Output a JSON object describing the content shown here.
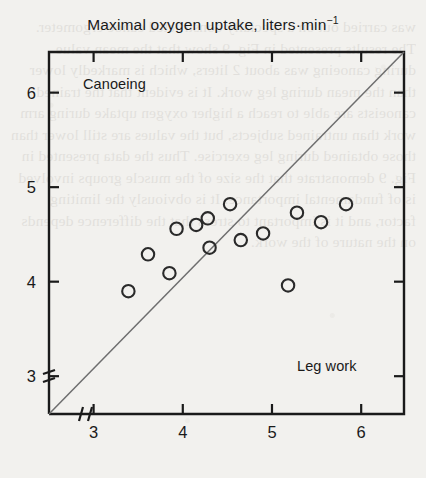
{
  "figure": {
    "title_main": "Maximal oxygen uptake, liters",
    "title_unit": "·min",
    "title_exp": "−1",
    "y_axis_label": "Canoeing",
    "x_axis_label": "Leg work"
  },
  "ghost_text": "was carried out on a specially constructed canoe ergometer. The results presented in Fig. 9 show that the mean value during canoeing was about 2 liters, which is markedly lower than the mean during leg work. It is evident that the trained canoeists are able to reach a higher oxygen uptake during arm work than untrained subjects, but the values are still lower than those obtained during leg exercise. Thus the data presented in Fig. 9 demonstrate that the size of the muscle groups involved is of fundamental importance. It is obviously the limiting factor, and it is important to stress that the difference depends on the nature of the work.",
  "chart_data": {
    "type": "scatter",
    "title": "Maximal oxygen uptake, liters·min−1",
    "xlabel": "Leg work",
    "ylabel": "Canoeing",
    "xlim": [
      2.5,
      6.48
    ],
    "ylim": [
      2.6,
      6.43
    ],
    "xticks": [
      3,
      4,
      5,
      6
    ],
    "yticks": [
      3,
      4,
      5,
      6
    ],
    "grid": false,
    "legend": null,
    "axis_break_x": true,
    "axis_break_y": true,
    "reference_line": {
      "name": "line-of-identity",
      "type": "identity",
      "from": [
        2.5,
        2.6
      ],
      "to": [
        6.48,
        6.43
      ]
    },
    "points": [
      {
        "x": 3.39,
        "y": 3.9
      },
      {
        "x": 3.61,
        "y": 4.29
      },
      {
        "x": 3.85,
        "y": 4.09
      },
      {
        "x": 3.93,
        "y": 4.56
      },
      {
        "x": 4.15,
        "y": 4.6
      },
      {
        "x": 4.28,
        "y": 4.67
      },
      {
        "x": 4.3,
        "y": 4.36
      },
      {
        "x": 4.53,
        "y": 4.82
      },
      {
        "x": 4.65,
        "y": 4.44
      },
      {
        "x": 4.9,
        "y": 4.51
      },
      {
        "x": 5.18,
        "y": 3.96
      },
      {
        "x": 5.28,
        "y": 4.73
      },
      {
        "x": 5.55,
        "y": 4.63
      },
      {
        "x": 5.83,
        "y": 4.82
      }
    ]
  },
  "style": {
    "ink": "#1a1a1a",
    "paper": "#f2f1ee",
    "line": "#6e6e6e",
    "marker_stroke": "#2a2a2a"
  }
}
